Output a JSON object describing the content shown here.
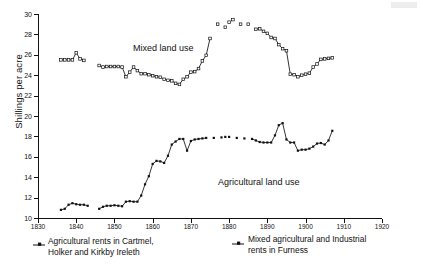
{
  "chart_data": {
    "type": "line",
    "title": "",
    "xlabel": "",
    "ylabel": "Shillings per acre",
    "xlim": [
      1830,
      1920
    ],
    "ylim": [
      10,
      30
    ],
    "xticks": [
      1830,
      1840,
      1850,
      1860,
      1870,
      1880,
      1890,
      1900,
      1910,
      1920
    ],
    "yticks": [
      10,
      12,
      14,
      16,
      18,
      20,
      22,
      24,
      26,
      28,
      30
    ],
    "grid": false,
    "legend_position": "below-plot",
    "annotations": [
      {
        "text": "Mixed land use",
        "x": 1857,
        "y": 26.9
      },
      {
        "text": "Agricultural land use",
        "x": 1875,
        "y": 14.6
      }
    ],
    "series": [
      {
        "name": "Mixed agricultural and Industrial rents in Furness",
        "label_short": "Mixed land use",
        "marker": "square",
        "color": "#111111",
        "segments": [
          {
            "marker_style": "open",
            "points": [
              [
                1836,
                25.5
              ],
              [
                1837,
                25.5
              ],
              [
                1838,
                25.5
              ],
              [
                1839,
                25.5
              ],
              [
                1840,
                26.2
              ],
              [
                1841,
                25.6
              ],
              [
                1842,
                25.45
              ]
            ]
          },
          {
            "marker_style": "open",
            "points": [
              [
                1846,
                24.95
              ],
              [
                1847,
                24.8
              ],
              [
                1848,
                24.85
              ],
              [
                1849,
                24.85
              ],
              [
                1850,
                24.85
              ],
              [
                1851,
                24.85
              ],
              [
                1852,
                24.8
              ],
              [
                1853,
                23.85
              ],
              [
                1854,
                24.3
              ],
              [
                1855,
                24.8
              ],
              [
                1856,
                24.45
              ],
              [
                1857,
                24.15
              ],
              [
                1858,
                24.15
              ],
              [
                1859,
                24.05
              ],
              [
                1860,
                23.95
              ],
              [
                1861,
                23.85
              ],
              [
                1862,
                23.8
              ],
              [
                1863,
                23.6
              ],
              [
                1864,
                23.5
              ],
              [
                1865,
                23.45
              ],
              [
                1866,
                23.2
              ],
              [
                1867,
                23.1
              ],
              [
                1868,
                23.6
              ],
              [
                1869,
                23.85
              ],
              [
                1870,
                24.3
              ],
              [
                1871,
                24.35
              ],
              [
                1872,
                24.65
              ],
              [
                1873,
                25.4
              ],
              [
                1874,
                25.95
              ],
              [
                1875,
                27.6
              ]
            ]
          },
          {
            "marker_style": "open-isolated",
            "points": [
              [
                1877,
                29.0
              ],
              [
                1879,
                28.7
              ],
              [
                1880,
                29.2
              ],
              [
                1881,
                29.45
              ],
              [
                1883,
                29.0
              ],
              [
                1885,
                29.0
              ]
            ]
          },
          {
            "marker_style": "open",
            "points": [
              [
                1887,
                28.5
              ],
              [
                1888,
                28.55
              ],
              [
                1889,
                28.3
              ],
              [
                1890,
                28.1
              ],
              [
                1891,
                27.7
              ],
              [
                1892,
                27.6
              ],
              [
                1893,
                27.0
              ],
              [
                1894,
                26.6
              ],
              [
                1895,
                26.4
              ],
              [
                1896,
                24.1
              ],
              [
                1897,
                24.05
              ],
              [
                1898,
                23.85
              ],
              [
                1899,
                24.0
              ],
              [
                1900,
                24.1
              ],
              [
                1901,
                24.2
              ],
              [
                1902,
                24.8
              ],
              [
                1903,
                25.1
              ],
              [
                1904,
                25.55
              ],
              [
                1905,
                25.6
              ],
              [
                1906,
                25.65
              ],
              [
                1907,
                25.7
              ]
            ]
          }
        ]
      },
      {
        "name": "Agricultural rents in Cartmel, Holker and Kirkby Ireleth",
        "label_short": "Agricultural land use",
        "marker": "square-filled",
        "color": "#111111",
        "segments": [
          {
            "marker_style": "filled",
            "points": [
              [
                1836,
                10.8
              ],
              [
                1837,
                10.9
              ],
              [
                1838,
                11.3
              ],
              [
                1839,
                11.45
              ],
              [
                1840,
                11.35
              ],
              [
                1841,
                11.3
              ],
              [
                1842,
                11.3
              ],
              [
                1843,
                11.2
              ]
            ]
          },
          {
            "marker_style": "filled",
            "points": [
              [
                1846,
                10.9
              ],
              [
                1847,
                11.1
              ],
              [
                1848,
                11.2
              ],
              [
                1849,
                11.2
              ],
              [
                1850,
                11.25
              ],
              [
                1851,
                11.2
              ],
              [
                1852,
                11.15
              ],
              [
                1853,
                11.6
              ],
              [
                1854,
                11.65
              ],
              [
                1855,
                11.6
              ],
              [
                1856,
                11.6
              ],
              [
                1857,
                12.2
              ],
              [
                1858,
                13.3
              ],
              [
                1859,
                14.1
              ],
              [
                1860,
                15.3
              ],
              [
                1861,
                15.6
              ],
              [
                1862,
                15.55
              ],
              [
                1863,
                15.4
              ],
              [
                1864,
                16.1
              ],
              [
                1865,
                17.2
              ],
              [
                1866,
                17.5
              ],
              [
                1867,
                17.75
              ],
              [
                1868,
                17.75
              ],
              [
                1869,
                16.6
              ],
              [
                1870,
                17.55
              ],
              [
                1871,
                17.7
              ],
              [
                1872,
                17.75
              ],
              [
                1873,
                17.8
              ],
              [
                1874,
                17.85
              ]
            ]
          },
          {
            "marker_style": "filled-isolated",
            "points": [
              [
                1876,
                17.85
              ],
              [
                1878,
                17.9
              ],
              [
                1879,
                17.95
              ],
              [
                1880,
                17.95
              ],
              [
                1882,
                17.85
              ],
              [
                1884,
                17.8
              ]
            ]
          },
          {
            "marker_style": "filled",
            "points": [
              [
                1886,
                17.75
              ],
              [
                1887,
                17.6
              ],
              [
                1888,
                17.45
              ],
              [
                1889,
                17.4
              ],
              [
                1890,
                17.4
              ],
              [
                1891,
                17.4
              ],
              [
                1892,
                18.1
              ],
              [
                1893,
                19.1
              ],
              [
                1894,
                19.3
              ],
              [
                1895,
                17.7
              ],
              [
                1896,
                17.4
              ],
              [
                1897,
                17.4
              ],
              [
                1898,
                16.6
              ],
              [
                1899,
                16.7
              ],
              [
                1900,
                16.7
              ],
              [
                1901,
                16.8
              ],
              [
                1902,
                17.0
              ],
              [
                1903,
                17.3
              ],
              [
                1904,
                17.35
              ],
              [
                1905,
                17.2
              ],
              [
                1906,
                17.6
              ],
              [
                1907,
                18.55
              ]
            ]
          }
        ]
      }
    ],
    "legend": [
      {
        "label_line1": "Agricultural rents in Cartmel,",
        "label_line2": "Holker and Kirkby Ireleth",
        "marker": "filled-square-with-line"
      },
      {
        "label_line1": "Mixed agricultural and Industrial",
        "label_line2": "rents in Furness",
        "marker": "filled-square-with-line"
      }
    ]
  }
}
